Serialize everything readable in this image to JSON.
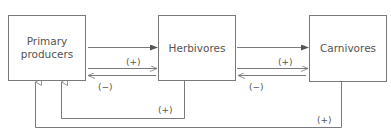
{
  "diagram": {
    "nodes": [
      {
        "id": "primary",
        "label_line1": "Primary",
        "label_line2": "producers"
      },
      {
        "id": "herbivores",
        "label": "Herbivores"
      },
      {
        "id": "carnivores",
        "label": "Carnivores"
      }
    ],
    "edges": [
      {
        "from": "primary",
        "to": "herbivores",
        "label": ""
      },
      {
        "from": "primary",
        "to": "herbivores",
        "label": "(+)"
      },
      {
        "from": "herbivores",
        "to": "primary",
        "label": "(−)"
      },
      {
        "from": "herbivores",
        "to": "carnivores",
        "label": ""
      },
      {
        "from": "herbivores",
        "to": "carnivores",
        "label": "(+)"
      },
      {
        "from": "carnivores",
        "to": "herbivores",
        "label": "(−)"
      },
      {
        "from": "herbivores",
        "to": "primary",
        "label": "(+)",
        "route": "below"
      },
      {
        "from": "carnivores",
        "to": "primary",
        "label": "(+)",
        "route": "below"
      }
    ],
    "labels": {
      "p_h_plus": "(+)",
      "h_p_minus": "(−)",
      "h_c_plus": "(+)",
      "c_h_minus": "(−)",
      "h_loop_plus": "(+)",
      "c_loop_plus": "(+)"
    }
  }
}
